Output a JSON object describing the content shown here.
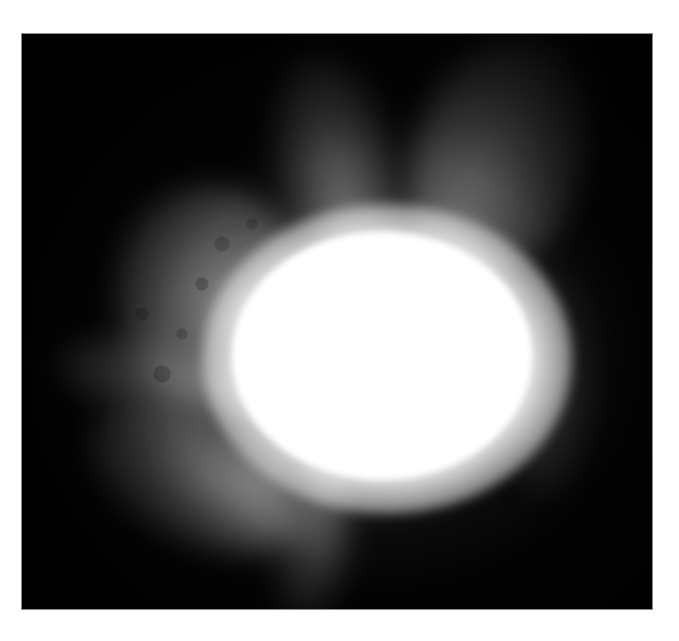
{
  "image": {
    "description": "Grayscale photograph of a bright white disk with diffuse gray corona-like streamers on a black background",
    "colors": {
      "background": "#030303",
      "disk": "#ffffff",
      "corona": "#9a9a9a",
      "border": "#ffffff"
    }
  }
}
